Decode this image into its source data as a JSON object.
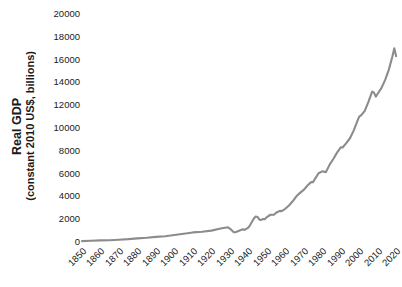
{
  "chart_data": {
    "type": "line",
    "title": "",
    "xlabel": "",
    "ylabel_line1": "Real GDP",
    "ylabel_line2": "(constant 2010 US$, billions)",
    "series_name": "Real GDP",
    "line_color": "#8c8c8c",
    "grid": false,
    "legend": "none",
    "xlim": [
      1850,
      2021
    ],
    "ylim": [
      0,
      20000
    ],
    "xticks": [
      "1850",
      "1860",
      "1870",
      "1880",
      "1890",
      "1900",
      "1910",
      "1920",
      "1930",
      "1940",
      "1950",
      "1960",
      "1970",
      "1980",
      "1990",
      "2000",
      "2010",
      "2020"
    ],
    "xtick_values": [
      1850,
      1860,
      1870,
      1880,
      1890,
      1900,
      1910,
      1920,
      1930,
      1940,
      1950,
      1960,
      1970,
      1980,
      1990,
      2000,
      2010,
      2020
    ],
    "yticks": [
      "0",
      "2000",
      "4000",
      "6000",
      "8000",
      "10000",
      "12000",
      "14000",
      "16000",
      "18000",
      "20000"
    ],
    "ytick_values": [
      0,
      2000,
      4000,
      6000,
      8000,
      10000,
      12000,
      14000,
      16000,
      18000,
      20000
    ],
    "x": [
      1850,
      1855,
      1860,
      1865,
      1870,
      1875,
      1880,
      1885,
      1890,
      1895,
      1900,
      1905,
      1910,
      1915,
      1920,
      1925,
      1929,
      1930,
      1932,
      1933,
      1935,
      1937,
      1938,
      1940,
      1941,
      1942,
      1943,
      1944,
      1945,
      1946,
      1947,
      1948,
      1949,
      1950,
      1952,
      1954,
      1955,
      1957,
      1958,
      1960,
      1962,
      1964,
      1966,
      1968,
      1970,
      1972,
      1974,
      1975,
      1976,
      1978,
      1980,
      1982,
      1984,
      1986,
      1988,
      1990,
      1991,
      1993,
      1995,
      1997,
      1999,
      2000,
      2001,
      2003,
      2005,
      2007,
      2008,
      2009,
      2010,
      2012,
      2014,
      2016,
      2018,
      2019,
      2020
    ],
    "y": [
      80,
      105,
      140,
      160,
      200,
      250,
      320,
      370,
      450,
      510,
      620,
      730,
      840,
      900,
      1000,
      1180,
      1290,
      1180,
      870,
      855,
      980,
      1120,
      1060,
      1270,
      1490,
      1770,
      2070,
      2230,
      2200,
      1960,
      1940,
      2020,
      2010,
      2180,
      2390,
      2400,
      2570,
      2730,
      2710,
      2910,
      3200,
      3570,
      4010,
      4310,
      4570,
      4960,
      5250,
      5240,
      5520,
      6030,
      6200,
      6130,
      6790,
      7280,
      7840,
      8300,
      8290,
      8680,
      9100,
      9770,
      10600,
      11000,
      11100,
      11500,
      12300,
      13200,
      13100,
      12750,
      13000,
      13500,
      14200,
      15100,
      16300,
      17000,
      16300
    ],
    "annotations": []
  }
}
